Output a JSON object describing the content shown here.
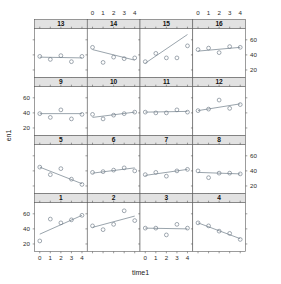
{
  "figure": {
    "kind": "lattice-trellis-panel-plot",
    "xlabel": "time1",
    "ylabel": "en1",
    "panel_rows": 4,
    "panel_cols": 4,
    "x_ticks": [
      0,
      1,
      2,
      3,
      4
    ],
    "y_ticks": [
      20,
      40,
      60
    ],
    "x_tick_labels": [
      "0",
      "1",
      "2",
      "3",
      "4"
    ],
    "y_tick_labels": [
      "20",
      "40",
      "60"
    ],
    "xlim": [
      -0.5,
      4.5
    ],
    "ylim": [
      10,
      75
    ],
    "point_color": "#6e7a86",
    "line_color": "#6f7c88",
    "strip_color": "#e2e2e2",
    "frame_color": "#5b5b5b",
    "background": "#ffffff",
    "top_axis_panels": [
      2,
      4
    ],
    "bottom_axis_panels": [
      1,
      3
    ],
    "left_axis_rows": [
      2,
      4
    ],
    "right_axis_rows": [
      1,
      3
    ]
  },
  "chart_data": {
    "type": "scatter",
    "title": "",
    "xlabel": "time1",
    "ylabel": "en1",
    "x": [
      0,
      1,
      2,
      3,
      4
    ],
    "xlim": [
      -0.5,
      4.5
    ],
    "ylim": [
      10,
      75
    ],
    "grid": false,
    "legend": null,
    "annotations": "Each panel is a subject; open circles are observations, line is the fitted per-subject regression.",
    "panel_layout": [
      [
        "13",
        "14",
        "15",
        "16"
      ],
      [
        "9",
        "10",
        "11",
        "12"
      ],
      [
        "5",
        "6",
        "7",
        "8"
      ],
      [
        "1",
        "2",
        "3",
        "4"
      ]
    ],
    "panels": [
      {
        "strip": "13",
        "row": 1,
        "col": 1,
        "values": [
          38,
          34,
          39,
          31,
          38
        ],
        "fit": {
          "y0": 37,
          "y4": 36
        }
      },
      {
        "strip": "14",
        "row": 1,
        "col": 2,
        "values": [
          50,
          30,
          37,
          35,
          36
        ],
        "fit": {
          "y0": 47,
          "y4": 33
        }
      },
      {
        "strip": "15",
        "row": 1,
        "col": 3,
        "values": [
          31,
          42,
          36,
          36,
          52
        ],
        "fit": {
          "y0": 29,
          "y4": 67
        }
      },
      {
        "strip": "16",
        "row": 1,
        "col": 4,
        "values": [
          47,
          49,
          43,
          51,
          50
        ],
        "fit": {
          "y0": 45,
          "y4": 50
        }
      },
      {
        "strip": "9",
        "row": 2,
        "col": 1,
        "values": [
          39,
          34,
          44,
          32,
          38
        ],
        "fit": {
          "y0": 39,
          "y4": 39
        }
      },
      {
        "strip": "10",
        "row": 2,
        "col": 2,
        "values": [
          38,
          32,
          37,
          39,
          41
        ],
        "fit": {
          "y0": 34,
          "y4": 41
        }
      },
      {
        "strip": "11",
        "row": 2,
        "col": 3,
        "values": [
          41,
          40,
          40,
          44,
          41
        ],
        "fit": {
          "y0": 41,
          "y4": 42
        }
      },
      {
        "strip": "12",
        "row": 2,
        "col": 4,
        "values": [
          43,
          45,
          57,
          46,
          51
        ],
        "fit": {
          "y0": 43,
          "y4": 52
        }
      },
      {
        "strip": "5",
        "row": 3,
        "col": 1,
        "values": [
          45,
          35,
          43,
          29,
          22
        ],
        "fit": {
          "y0": 45,
          "y4": 23
        }
      },
      {
        "strip": "6",
        "row": 3,
        "col": 2,
        "values": [
          38,
          39,
          41,
          44,
          40
        ],
        "fit": {
          "y0": 37,
          "y4": 44
        }
      },
      {
        "strip": "7",
        "row": 3,
        "col": 3,
        "values": [
          35,
          38,
          33,
          40,
          42
        ],
        "fit": {
          "y0": 34,
          "y4": 42
        }
      },
      {
        "strip": "8",
        "row": 3,
        "col": 4,
        "values": [
          40,
          31,
          37,
          37,
          36
        ],
        "fit": {
          "y0": 38,
          "y4": 36
        }
      },
      {
        "strip": "1",
        "row": 4,
        "col": 1,
        "values": [
          24,
          53,
          48,
          52,
          58
        ],
        "fit": {
          "y0": 33,
          "y4": 58
        }
      },
      {
        "strip": "2",
        "row": 4,
        "col": 2,
        "values": [
          44,
          39,
          46,
          64,
          51
        ],
        "fit": {
          "y0": 42,
          "y4": 57
        }
      },
      {
        "strip": "3",
        "row": 4,
        "col": 3,
        "values": [
          41,
          41,
          32,
          46,
          41
        ],
        "fit": {
          "y0": 41,
          "y4": 40
        }
      },
      {
        "strip": "4",
        "row": 4,
        "col": 4,
        "values": [
          48,
          44,
          37,
          34,
          26
        ],
        "fit": {
          "y0": 48,
          "y4": 27
        }
      }
    ]
  }
}
